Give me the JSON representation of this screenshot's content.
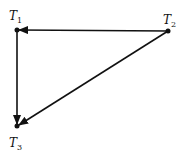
{
  "diagram": {
    "type": "directed-graph",
    "nodes": [
      {
        "id": "T1",
        "label": "T",
        "sub": "1",
        "x": 17,
        "y": 30
      },
      {
        "id": "T2",
        "label": "T",
        "sub": "2",
        "x": 168,
        "y": 31
      },
      {
        "id": "T3",
        "label": "T",
        "sub": "3",
        "x": 17,
        "y": 126
      }
    ],
    "edges": [
      {
        "from": "T2",
        "to": "T1"
      },
      {
        "from": "T1",
        "to": "T3"
      },
      {
        "from": "T2",
        "to": "T3"
      }
    ],
    "colors": {
      "stroke": "#111111",
      "background": "#ffffff"
    }
  }
}
